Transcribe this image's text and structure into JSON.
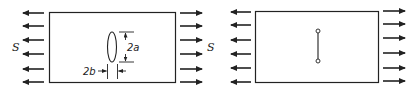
{
  "figure": {
    "panels": [
      {
        "id": "left",
        "description": "Plate under uniaxial tension with elliptical hole",
        "stress_label_left": "S",
        "stress_label_right": "S",
        "hole_height_label": "2a",
        "hole_width_label": "2b",
        "arrow_count_per_side": 6
      },
      {
        "id": "right",
        "description": "Plate under uniaxial tension with crack (degenerate ellipse)",
        "arrow_count_per_side": 6
      }
    ],
    "colors": {
      "line": "#222222",
      "background": "#ffffff"
    }
  }
}
